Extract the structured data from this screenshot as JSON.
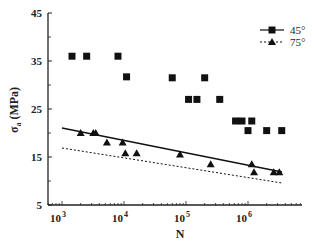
{
  "chart_data": {
    "type": "scatter",
    "title": "",
    "xlabel": "N",
    "ylabel": "σa (MPa)",
    "xscale": "log",
    "xlim": [
      700,
      5000000
    ],
    "ylim": [
      5,
      45
    ],
    "x_ticks": [
      "10^3",
      "10^4",
      "10^5",
      "10^6"
    ],
    "y_ticks": [
      5,
      15,
      25,
      35,
      45
    ],
    "grid": false,
    "legend_position": "upper right",
    "series": [
      {
        "name": "45°",
        "marker": "square",
        "line": "solid",
        "points": [
          [
            1450,
            36
          ],
          [
            2500,
            36
          ],
          [
            8000,
            36
          ],
          [
            11000,
            31.7
          ],
          [
            60000,
            31.5
          ],
          [
            200000,
            31.5
          ],
          [
            110000,
            27
          ],
          [
            150000,
            27
          ],
          [
            350000,
            27
          ],
          [
            630000,
            22.5
          ],
          [
            800000,
            22.5
          ],
          [
            1150000,
            22.5
          ],
          [
            1000000,
            20.5
          ],
          [
            2000000,
            20.5
          ],
          [
            3500000,
            20.5
          ]
        ]
      },
      {
        "name": "75°",
        "marker": "triangle",
        "line": "dotted",
        "points": [
          [
            2000,
            20
          ],
          [
            3200,
            20
          ],
          [
            3500,
            20
          ],
          [
            5300,
            18
          ],
          [
            9500,
            18
          ],
          [
            10500,
            15.8
          ],
          [
            16000,
            15.8
          ],
          [
            80000,
            15.5
          ],
          [
            250000,
            13.5
          ],
          [
            1150000,
            13.5
          ],
          [
            1250000,
            11.8
          ],
          [
            2600000,
            11.8
          ],
          [
            3200000,
            11.8
          ]
        ]
      }
    ],
    "fit_lines": [
      {
        "name": "45° fit (solid)",
        "from": [
          1000,
          21.2
        ],
        "to": [
          3500000,
          12
        ]
      },
      {
        "name": "75° fit (dotted)",
        "from": [
          1000,
          17
        ],
        "to": [
          3500000,
          9.7
        ]
      }
    ]
  },
  "labels": {
    "xlabel": "N",
    "ylabel_main": "σ",
    "ylabel_sub": "a",
    "ylabel_unit": " (MPa)",
    "legend": [
      "45°",
      "75°"
    ],
    "y_ticks": [
      "45",
      "35",
      "25",
      "15",
      "5"
    ],
    "x_ticks_base": "10",
    "x_ticks_exp": [
      "3",
      "4",
      "5",
      "6"
    ]
  }
}
